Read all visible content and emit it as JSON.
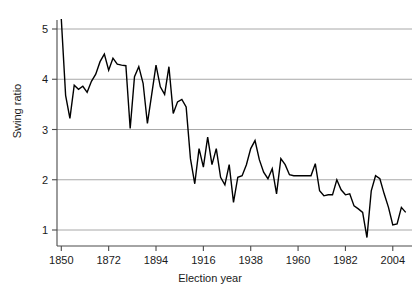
{
  "chart_data": {
    "type": "line",
    "title": "",
    "xlabel": "Election year",
    "ylabel": "Swing ratio",
    "xlim": [
      1848,
      2012
    ],
    "ylim": [
      0.72,
      5.35
    ],
    "xticks": [
      1850,
      1872,
      1894,
      1916,
      1938,
      1960,
      1982,
      2004
    ],
    "xtick_labels": [
      "1850",
      "1872",
      "1894",
      "1916",
      "1938",
      "1960",
      "1982",
      "2004"
    ],
    "yticks": [
      1,
      2,
      3,
      4,
      5
    ],
    "ytick_labels": [
      "1",
      "2",
      "3",
      "4",
      "5"
    ],
    "grid": "horizontal",
    "grid_color": "#a8a8a8",
    "line_color": "#000000",
    "line_width": 1.4,
    "legend": null,
    "series": [
      {
        "name": "Swing ratio",
        "x": [
          1850,
          1852,
          1854,
          1856,
          1858,
          1860,
          1862,
          1864,
          1866,
          1868,
          1870,
          1872,
          1874,
          1876,
          1878,
          1880,
          1882,
          1884,
          1886,
          1888,
          1890,
          1892,
          1894,
          1896,
          1898,
          1900,
          1902,
          1904,
          1906,
          1908,
          1910,
          1912,
          1914,
          1916,
          1918,
          1920,
          1922,
          1924,
          1926,
          1928,
          1930,
          1932,
          1934,
          1936,
          1938,
          1940,
          1942,
          1944,
          1946,
          1948,
          1950,
          1952,
          1954,
          1956,
          1958,
          1960,
          1962,
          1964,
          1966,
          1968,
          1970,
          1972,
          1974,
          1976,
          1978,
          1980,
          1982,
          1984,
          1986,
          1988,
          1990,
          1992,
          1994,
          1996,
          1998,
          2000,
          2002,
          2004,
          2006,
          2008,
          2010
        ],
        "values": [
          5.2,
          3.68,
          3.22,
          3.88,
          3.8,
          3.86,
          3.74,
          3.96,
          4.1,
          4.35,
          4.5,
          4.18,
          4.42,
          4.3,
          4.28,
          4.27,
          3.02,
          4.05,
          4.25,
          3.92,
          3.12,
          3.7,
          4.28,
          3.85,
          3.7,
          4.25,
          3.32,
          3.55,
          3.6,
          3.45,
          2.42,
          1.92,
          2.62,
          2.25,
          2.85,
          2.3,
          2.62,
          2.05,
          1.9,
          2.3,
          1.55,
          2.05,
          2.08,
          2.3,
          2.62,
          2.78,
          2.4,
          2.15,
          2.02,
          2.22,
          1.72,
          2.42,
          2.3,
          2.1,
          2.08,
          2.08,
          2.08,
          2.08,
          2.08,
          2.32,
          1.78,
          1.68,
          1.7,
          1.7,
          2.0,
          1.8,
          1.7,
          1.72,
          1.48,
          1.42,
          1.35,
          0.85,
          1.78,
          2.08,
          2.02,
          1.72,
          1.45,
          1.1,
          1.12,
          1.45,
          1.35
        ]
      }
    ]
  },
  "axes": {
    "y_axis_name": "y-axis",
    "x_axis_name": "x-axis"
  }
}
